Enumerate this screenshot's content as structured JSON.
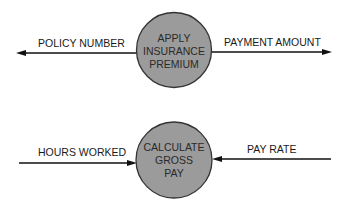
{
  "diagrams": [
    {
      "process": {
        "lines": [
          "APPLY",
          "INSURANCE",
          "PREMIUM"
        ]
      },
      "flows": [
        {
          "label": "POLICY NUMBER",
          "direction": "outgoing-left"
        },
        {
          "label": "PAYMENT AMOUNT",
          "direction": "outgoing-right"
        }
      ]
    },
    {
      "process": {
        "lines": [
          "CALCULATE",
          "GROSS",
          "PAY"
        ]
      },
      "flows": [
        {
          "label": "HOURS WORKED",
          "direction": "incoming-from-left"
        },
        {
          "label": "PAY RATE",
          "direction": "incoming-from-right"
        }
      ]
    }
  ],
  "colors": {
    "process_fill": "#9b9b9b",
    "outline": "#333333",
    "arrow": "#111111"
  }
}
